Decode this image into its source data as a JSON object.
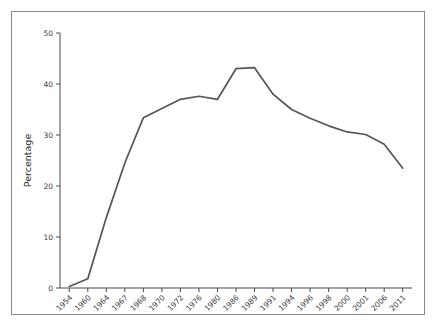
{
  "figure": {
    "background_color": "#ffffff",
    "border_color": "#8a8a8a",
    "axis_color": "#4a4a4a"
  },
  "chart_data": {
    "type": "line",
    "title": "",
    "subtitle": "",
    "xlabel": "",
    "ylabel": "Percentage",
    "categories": [
      "1954",
      "1960",
      "1964",
      "1967",
      "1968",
      "1970",
      "1972",
      "1976",
      "1980",
      "1986",
      "1989",
      "1991",
      "1994",
      "1996",
      "1998",
      "2000",
      "2001",
      "2006",
      "2011"
    ],
    "values": [
      0.3,
      1.8,
      13.8,
      24.5,
      33.4,
      35.2,
      37.0,
      37.6,
      37.0,
      43.0,
      43.2,
      38.0,
      35.0,
      33.3,
      31.8,
      30.6,
      30.1,
      28.2,
      23.5
    ],
    "series": [
      {
        "name": "Percentage",
        "color": "#555555",
        "values": [
          0.3,
          1.8,
          13.8,
          24.5,
          33.4,
          35.2,
          37.0,
          37.6,
          37.0,
          43.0,
          43.2,
          38.0,
          35.0,
          33.3,
          31.8,
          30.6,
          30.1,
          28.2,
          23.5
        ]
      }
    ],
    "ylim": [
      0,
      50
    ],
    "yticks": [
      0,
      10,
      20,
      30,
      40,
      50
    ],
    "ytick_labels": [
      "0",
      "10",
      "20",
      "30",
      "40",
      "50"
    ],
    "xtick_labels": [
      "1954",
      "1960",
      "1964",
      "1967",
      "1968",
      "1970",
      "1972",
      "1976",
      "1980",
      "1986",
      "1989",
      "1991",
      "1994",
      "1996",
      "1998",
      "2000",
      "2001",
      "2006",
      "2011"
    ],
    "xtick_rotation": -45,
    "grid": false,
    "legend": null,
    "legend_position": "none",
    "annotations": []
  }
}
